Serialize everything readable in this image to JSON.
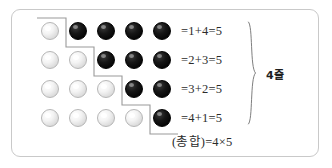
{
  "figure": {
    "type": "go-stone-array-diagram",
    "frame": {
      "border_color": "#c9c9c9",
      "background": "#ffffff"
    },
    "grid": {
      "rows": 4,
      "columns": 5,
      "circle_diameter_px": 18,
      "column_x": [
        41,
        69,
        97,
        125,
        153
      ],
      "row_y": [
        22,
        51,
        80,
        109
      ],
      "white_color": "#efefef",
      "black_color": "#0a0a0a",
      "rows_data": [
        {
          "white": 1,
          "black": 4,
          "cells": [
            "white",
            "black",
            "black",
            "black",
            "black"
          ]
        },
        {
          "white": 2,
          "black": 3,
          "cells": [
            "white",
            "white",
            "black",
            "black",
            "black"
          ]
        },
        {
          "white": 3,
          "black": 2,
          "cells": [
            "white",
            "white",
            "white",
            "black",
            "black"
          ]
        },
        {
          "white": 4,
          "black": 1,
          "cells": [
            "white",
            "white",
            "white",
            "white",
            "black"
          ]
        }
      ]
    },
    "stair_line": {
      "color": "#9a9a9a",
      "description": "stepped boundary between white and black stones"
    },
    "equations": [
      "=1+4=5",
      "=2+3=5",
      "=3+2=5",
      "=4+1=5"
    ],
    "brace": {
      "label": "4줄",
      "color": "#707070",
      "side": "right",
      "spans_rows": 4
    },
    "total": "(총합)=4×5"
  },
  "chart_data": {
    "type": "table",
    "title": "",
    "categories": [
      "1줄",
      "2줄",
      "3줄",
      "4줄"
    ],
    "series": [
      {
        "name": "white",
        "values": [
          1,
          2,
          3,
          4
        ]
      },
      {
        "name": "black",
        "values": [
          4,
          3,
          2,
          1
        ]
      },
      {
        "name": "sum",
        "values": [
          5,
          5,
          5,
          5
        ]
      }
    ],
    "annotations": [
      "=1+4=5",
      "=2+3=5",
      "=3+2=5",
      "=4+1=5",
      "4줄",
      "(총합)=4×5"
    ],
    "legend": null,
    "grid": false
  }
}
